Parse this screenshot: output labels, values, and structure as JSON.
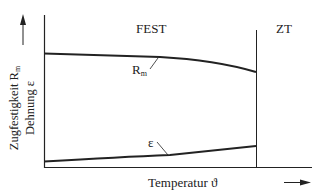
{
  "diagram": {
    "regions": [
      {
        "label": "FEST",
        "x_range": "left of divider"
      },
      {
        "label": "ZT",
        "x_range": "right of divider"
      }
    ],
    "x_axis": {
      "label": "Temperatur ϑ"
    },
    "y_axis": {
      "line1": "Zugfestigkeit R",
      "line1_sub": "m",
      "line2": "Dehnung ε"
    },
    "curves": [
      {
        "name": "R",
        "sub": "m",
        "trend": "slightly decreasing, drops faster near ZT"
      },
      {
        "name": "ε",
        "trend": "slightly increasing"
      }
    ],
    "colors": {
      "line": "#222222",
      "background": "#ffffff"
    }
  }
}
